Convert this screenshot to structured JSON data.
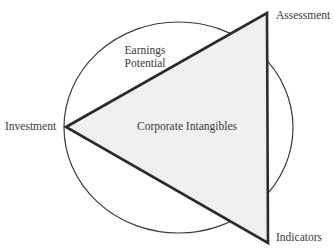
{
  "diagram": {
    "type": "triangle-over-circle",
    "colors": {
      "stroke": "#2b2b2b",
      "triangle_fill": "#efefef",
      "text": "#3a3a3a",
      "background": "#ffffff"
    },
    "vertices": {
      "left": {
        "label": "Investment"
      },
      "top_right": {
        "label": "Assessment"
      },
      "bottom_right": {
        "label": "Indicators"
      }
    },
    "regions": {
      "triangle_interior": {
        "label": "Corporate Intangibles"
      },
      "upper_circle_segment": {
        "label_line1": "Earnings",
        "label_line2": "Potential"
      }
    }
  }
}
